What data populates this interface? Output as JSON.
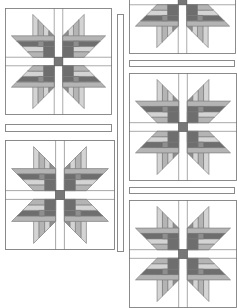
{
  "colors": {
    "background": "#ffffff",
    "outline": "#7a7a7a",
    "sash_border": "#8a8a8a",
    "shade_light": "#d4d4d4",
    "shade_mid": "#b4b4b4",
    "shade_dark": "#8e8e8e",
    "shade_darker": "#6e6e6e",
    "center": "#777777"
  },
  "blocks": [
    {
      "id": "left-top",
      "x": 5,
      "y": 8,
      "size": 107
    },
    {
      "id": "left-bottom",
      "x": 5,
      "y": 140,
      "size": 110
    },
    {
      "id": "right-top-partial",
      "x": 129,
      "y": -53,
      "size": 107
    },
    {
      "id": "right-middle",
      "x": 129,
      "y": 73,
      "size": 108
    },
    {
      "id": "right-bottom-partial",
      "x": 129,
      "y": 200,
      "size": 108
    }
  ],
  "sashing": [
    {
      "id": "left-horizontal",
      "x": 5,
      "y": 124,
      "w": 107,
      "h": 8
    },
    {
      "id": "center-vertical",
      "x": 117,
      "y": 14,
      "w": 7,
      "h": 238
    },
    {
      "id": "right-horizontal-1",
      "x": 129,
      "y": 60,
      "w": 106,
      "h": 7
    },
    {
      "id": "right-horizontal-2",
      "x": 129,
      "y": 187,
      "w": 106,
      "h": 7
    }
  ]
}
